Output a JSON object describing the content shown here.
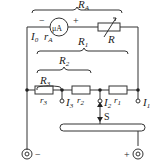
{
  "diagram": {
    "type": "circuit",
    "labels": {
      "RA": "R",
      "RA_sub": "A",
      "minus_top": "−",
      "plus_top": "+",
      "meter": "μA",
      "I0": "I",
      "I0_sub": "0",
      "rA": "r",
      "rA_sub": "A",
      "R_var": "R",
      "R1": "R",
      "R1_sub": "1",
      "R2": "R",
      "R2_sub": "2",
      "R3": "R",
      "R3_sub": "3",
      "r3": "r",
      "r3_sub": "3",
      "r2": "r",
      "r2_sub": "2",
      "r1": "r",
      "r1_sub": "1",
      "I3": "I",
      "I3_sub": "3",
      "I2": "I",
      "I2_sub": "2",
      "I1": "I",
      "I1_sub": "1",
      "switch": "S",
      "minus_bottom": "−",
      "plus_bottom": "+"
    },
    "colors": {
      "line": "#333333",
      "background": "#ffffff"
    }
  }
}
